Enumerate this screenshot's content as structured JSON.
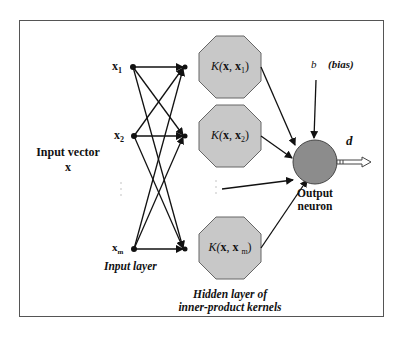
{
  "diagram": {
    "type": "rbf-svm-network",
    "input_label_line1": "Input vector",
    "input_label_line2": "x",
    "input_layer_label": "Input layer",
    "hidden_layer_label_line1": "Hidden layer of",
    "hidden_layer_label_line2": "inner-product kernels",
    "output_label_line1": "Output",
    "output_label_line2": "neuron",
    "bias_symbol": "b",
    "bias_label": "(bias)",
    "output_symbol": "d",
    "inputs": [
      {
        "label": "x",
        "sub": "1"
      },
      {
        "label": "x",
        "sub": "2"
      },
      {
        "label": "x",
        "sub": "m"
      }
    ],
    "kernels": [
      {
        "prefix": "K(",
        "x": "x",
        "sep": ", ",
        "xi": "x",
        "sub": "1",
        "suffix": ")"
      },
      {
        "prefix": "K(",
        "x": "x",
        "sep": ", ",
        "xi": "x",
        "sub": "2",
        "suffix": ")"
      },
      {
        "prefix": "K(",
        "x": "x",
        "sep": ", ",
        "xi": "x ",
        "sub": "m",
        "suffix": ")"
      }
    ],
    "colors": {
      "kernel_fill": "#c8c8c8",
      "neuron_fill": "#8c8c8c",
      "line": "#111111",
      "frame": "#555555"
    }
  }
}
